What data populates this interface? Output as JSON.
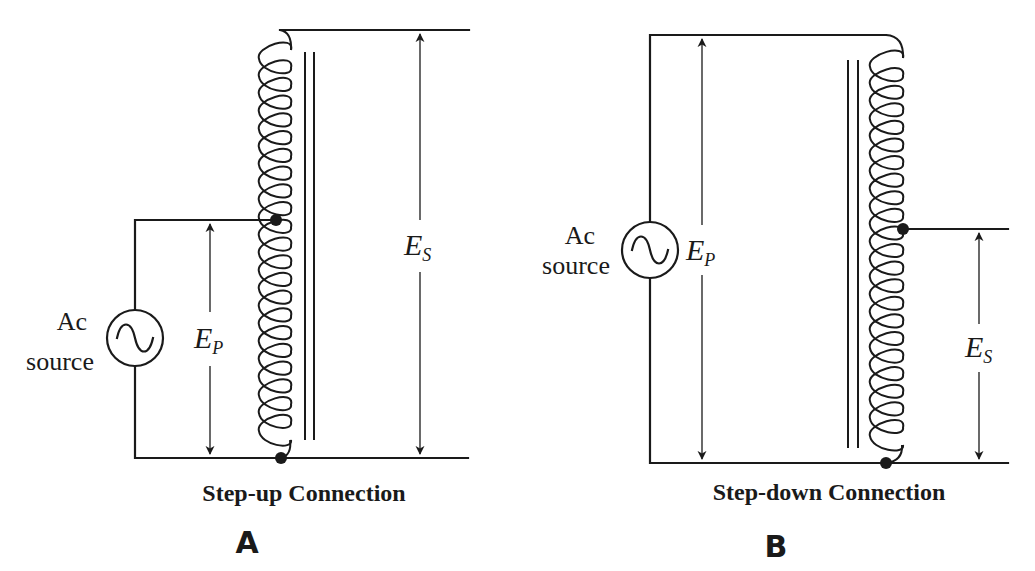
{
  "diagrams": [
    {
      "id": "A",
      "letter": "A",
      "caption": "Step-up Connection",
      "source_label_line1": "Ac",
      "source_label_line2": "source",
      "primary_voltage": {
        "main": "E",
        "sub": "P"
      },
      "secondary_voltage": {
        "main": "E",
        "sub": "S"
      },
      "coil_turns": 22,
      "tap_after_turns": 9
    },
    {
      "id": "B",
      "letter": "B",
      "caption": "Step-down Connection",
      "source_label_line1": "Ac",
      "source_label_line2": "source",
      "primary_voltage": {
        "main": "E",
        "sub": "P"
      },
      "secondary_voltage": {
        "main": "E",
        "sub": "S"
      },
      "coil_turns": 22,
      "tap_after_turns": 9
    }
  ],
  "icons": {
    "source_symbol": "ac-sine-source-icon",
    "junction": "junction-dot-icon",
    "winding": "transformer-coil-icon",
    "core": "iron-core-icon"
  },
  "colors": {
    "ink": "#1a1a1a",
    "background": "#ffffff"
  }
}
